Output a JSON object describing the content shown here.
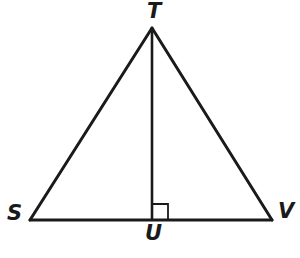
{
  "figure": {
    "background_color": "#ffffff",
    "stroke_color": "#1a1a1a",
    "labels": {
      "apex": "T",
      "left_base": "S",
      "right_base": "V",
      "foot_of_altitude": "U"
    },
    "points": {
      "T": {
        "x": 152,
        "y": 28
      },
      "S": {
        "x": 30,
        "y": 220
      },
      "V": {
        "x": 272,
        "y": 220
      },
      "U": {
        "x": 152,
        "y": 220
      }
    },
    "segments": [
      {
        "name": "ST",
        "from": "S",
        "to": "T"
      },
      {
        "name": "TV",
        "from": "T",
        "to": "V"
      },
      {
        "name": "SV",
        "from": "S",
        "to": "V"
      },
      {
        "name": "TU",
        "from": "T",
        "to": "U"
      }
    ],
    "right_angle": {
      "at": "U",
      "side": "right",
      "size": 16,
      "symbol": "right-angle-square"
    },
    "stroke_widths": {
      "triangle": 3,
      "altitude": 2.6,
      "right_angle": 1.8
    }
  }
}
